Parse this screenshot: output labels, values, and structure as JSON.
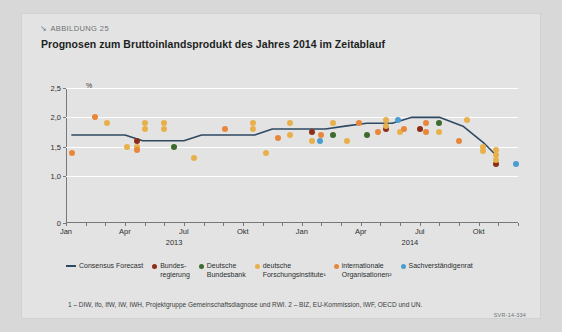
{
  "figure": {
    "kicker": "ABBILDUNG 25",
    "kicker_icon": "arrow-down-right-icon",
    "title": "Prognosen zum Bruttoinlandsprodukt des Jahres 2014 im Zeitablauf",
    "footnote": "1 – DIW, ifo, IfW, IW, IWH, Projektgruppe Gemeinschaftsdiagnose und RWI.  2 – BIZ, EU-Kommission, IWF, OECD und UN.",
    "source_code": "SVR-14-334"
  },
  "colors": {
    "consensus_forecast": "#2e4a63",
    "bundesregierung": "#8c2d18",
    "deutsche_bundesbank": "#3d6b2e",
    "deutsche_forschungsinstitute": "#e8b04b",
    "internationale_organisationen": "#e8873b",
    "sachverstaendigenrat": "#4a9dd0",
    "panel_background": "#e3e3e3",
    "gridline": "#ffffff",
    "axis": "#76797c"
  },
  "legend": {
    "items": [
      {
        "label": "Consensus Forecast",
        "marker": "line",
        "color": "#2e4a63"
      },
      {
        "label": "Bundes-\nregierung",
        "marker": "dot",
        "color": "#8c2d18"
      },
      {
        "label": "Deutsche\nBundesbank",
        "marker": "dot",
        "color": "#3d6b2e"
      },
      {
        "label": "deutsche\nForschungsinstitute¹",
        "marker": "dot",
        "color": "#e8b04b"
      },
      {
        "label": "internationale\nOrganisationen²",
        "marker": "dot",
        "color": "#e8873b"
      },
      {
        "label": "Sachverständigenrat",
        "marker": "dot",
        "color": "#4a9dd0"
      }
    ]
  },
  "chart_data": {
    "type": "scatter",
    "title": "Prognosen zum Bruttoinlandsprodukt des Jahres 2014 im Zeitablauf",
    "xlabel": "",
    "ylabel": "%",
    "ylim": [
      0,
      2.5
    ],
    "yticks": [
      0,
      1.0,
      1.5,
      2.0,
      2.5
    ],
    "ytick_labels": [
      "0",
      "1,0",
      "1,5",
      "2,0",
      "2,5"
    ],
    "y_axis_break": true,
    "grid": true,
    "legend_position": "bottom",
    "xlim": [
      0,
      23
    ],
    "x_months": [
      "Jan",
      "Feb",
      "Mrz",
      "Apr",
      "Mai",
      "Jun",
      "Jul",
      "Aug",
      "Sep",
      "Okt",
      "Nov",
      "Dez",
      "Jan",
      "Feb",
      "Mrz",
      "Apr",
      "Mai",
      "Jun",
      "Jul",
      "Aug",
      "Sep",
      "Okt",
      "Nov",
      "Dez"
    ],
    "xtick_labels": [
      {
        "index": 0,
        "label": "Jan"
      },
      {
        "index": 3,
        "label": "Apr"
      },
      {
        "index": 6,
        "label": "Jul"
      },
      {
        "index": 9,
        "label": "Okt"
      },
      {
        "index": 12,
        "label": "Jan"
      },
      {
        "index": 15,
        "label": "Apr"
      },
      {
        "index": 18,
        "label": "Jul"
      },
      {
        "index": 21,
        "label": "Okt"
      }
    ],
    "year_labels": [
      {
        "index": 5.5,
        "label": "2013"
      },
      {
        "index": 17.5,
        "label": "2014"
      }
    ],
    "series": [
      {
        "name": "Consensus Forecast",
        "type": "line",
        "color": "#2e4a63",
        "points": [
          {
            "x": 0.3,
            "y": 1.7
          },
          {
            "x": 3.0,
            "y": 1.7
          },
          {
            "x": 3.9,
            "y": 1.6
          },
          {
            "x": 6.0,
            "y": 1.6
          },
          {
            "x": 6.9,
            "y": 1.7
          },
          {
            "x": 9.6,
            "y": 1.7
          },
          {
            "x": 10.5,
            "y": 1.8
          },
          {
            "x": 13.2,
            "y": 1.8
          },
          {
            "x": 14.2,
            "y": 1.85
          },
          {
            "x": 15.3,
            "y": 1.9
          },
          {
            "x": 16.6,
            "y": 1.9
          },
          {
            "x": 17.6,
            "y": 2.0
          },
          {
            "x": 19.0,
            "y": 2.0
          },
          {
            "x": 20.2,
            "y": 1.85
          },
          {
            "x": 21.3,
            "y": 1.55
          },
          {
            "x": 21.9,
            "y": 1.35
          }
        ]
      },
      {
        "name": "Bundesregierung",
        "type": "scatter",
        "color": "#8c2d18",
        "points": [
          {
            "x": 3.6,
            "y": 1.6
          },
          {
            "x": 12.5,
            "y": 1.75
          },
          {
            "x": 16.3,
            "y": 1.8
          },
          {
            "x": 18.0,
            "y": 1.8
          },
          {
            "x": 21.9,
            "y": 1.2
          }
        ]
      },
      {
        "name": "Deutsche Bundesbank",
        "type": "scatter",
        "color": "#3d6b2e",
        "points": [
          {
            "x": 5.5,
            "y": 1.5
          },
          {
            "x": 13.6,
            "y": 1.7
          },
          {
            "x": 15.3,
            "y": 1.7
          },
          {
            "x": 19.0,
            "y": 1.9
          }
        ]
      },
      {
        "name": "deutsche Forschungsinstitute",
        "type": "scatter",
        "color": "#e8b04b",
        "points": [
          {
            "x": 2.1,
            "y": 1.9
          },
          {
            "x": 3.1,
            "y": 1.5
          },
          {
            "x": 3.6,
            "y": 1.5
          },
          {
            "x": 4.0,
            "y": 1.9
          },
          {
            "x": 4.0,
            "y": 1.8
          },
          {
            "x": 5.0,
            "y": 1.9
          },
          {
            "x": 5.0,
            "y": 1.8
          },
          {
            "x": 6.5,
            "y": 1.3
          },
          {
            "x": 9.5,
            "y": 1.9
          },
          {
            "x": 9.5,
            "y": 1.8
          },
          {
            "x": 10.2,
            "y": 1.4
          },
          {
            "x": 11.4,
            "y": 1.9
          },
          {
            "x": 11.4,
            "y": 1.7
          },
          {
            "x": 12.5,
            "y": 1.6
          },
          {
            "x": 13.6,
            "y": 1.9
          },
          {
            "x": 14.3,
            "y": 1.6
          },
          {
            "x": 16.3,
            "y": 1.95
          },
          {
            "x": 16.3,
            "y": 1.85
          },
          {
            "x": 17.0,
            "y": 1.75
          },
          {
            "x": 19.0,
            "y": 1.75
          },
          {
            "x": 20.4,
            "y": 1.95
          },
          {
            "x": 21.2,
            "y": 1.5
          },
          {
            "x": 21.2,
            "y": 1.42
          },
          {
            "x": 21.9,
            "y": 1.45
          },
          {
            "x": 21.9,
            "y": 1.35
          },
          {
            "x": 21.9,
            "y": 1.27
          }
        ]
      },
      {
        "name": "internationale Organisationen",
        "type": "scatter",
        "color": "#e8873b",
        "points": [
          {
            "x": 0.3,
            "y": 1.4
          },
          {
            "x": 1.5,
            "y": 2.0
          },
          {
            "x": 3.6,
            "y": 1.45
          },
          {
            "x": 8.1,
            "y": 1.8
          },
          {
            "x": 10.8,
            "y": 1.65
          },
          {
            "x": 13.0,
            "y": 1.7
          },
          {
            "x": 14.9,
            "y": 1.9
          },
          {
            "x": 15.9,
            "y": 1.75
          },
          {
            "x": 17.2,
            "y": 1.8
          },
          {
            "x": 18.3,
            "y": 1.9
          },
          {
            "x": 18.3,
            "y": 1.75
          },
          {
            "x": 20.0,
            "y": 1.6
          }
        ]
      },
      {
        "name": "Sachverständigenrat",
        "type": "scatter",
        "color": "#4a9dd0",
        "points": [
          {
            "x": 12.9,
            "y": 1.6
          },
          {
            "x": 16.9,
            "y": 1.95
          },
          {
            "x": 22.9,
            "y": 1.2
          }
        ]
      }
    ]
  }
}
